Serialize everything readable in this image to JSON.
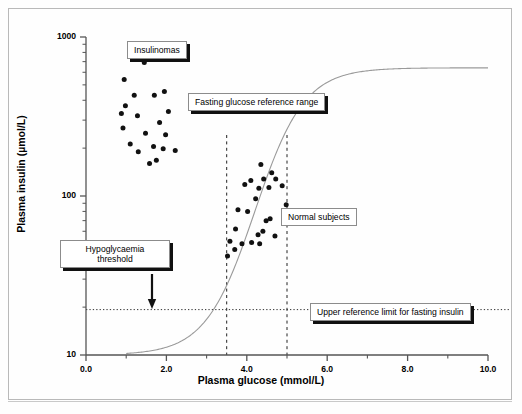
{
  "chart_data": {
    "type": "scatter",
    "title": "",
    "xlabel": "Plasma glucose (mmol/L)",
    "ylabel": "Plasma insulin (µmol/L)",
    "xlim": [
      0.0,
      10.0
    ],
    "ylim": [
      10,
      1000
    ],
    "yscale": "log",
    "xticks": [
      "0.0",
      "2.0",
      "4.0",
      "6.0",
      "8.0",
      "10.0"
    ],
    "xtick_values": [
      0.0,
      2.0,
      4.0,
      6.0,
      8.0,
      10.0
    ],
    "xminor_values": [
      1.0,
      3.0,
      5.0,
      7.0,
      9.0
    ],
    "yticks": [
      "10",
      "100",
      "1000"
    ],
    "ytick_values": [
      10,
      100,
      1000
    ],
    "grid": false,
    "legend": "none",
    "series": [
      {
        "name": "Insulinomas",
        "marker": "filled-circle",
        "color": "#111111",
        "points": [
          {
            "x": 1.45,
            "y": 690
          },
          {
            "x": 0.95,
            "y": 540
          },
          {
            "x": 1.2,
            "y": 430
          },
          {
            "x": 1.7,
            "y": 430
          },
          {
            "x": 1.95,
            "y": 455
          },
          {
            "x": 0.98,
            "y": 370
          },
          {
            "x": 2.05,
            "y": 340
          },
          {
            "x": 1.28,
            "y": 320
          },
          {
            "x": 1.83,
            "y": 290
          },
          {
            "x": 0.92,
            "y": 268
          },
          {
            "x": 1.48,
            "y": 248
          },
          {
            "x": 1.98,
            "y": 243
          },
          {
            "x": 1.1,
            "y": 212
          },
          {
            "x": 1.68,
            "y": 205
          },
          {
            "x": 1.92,
            "y": 198
          },
          {
            "x": 1.3,
            "y": 190
          },
          {
            "x": 2.22,
            "y": 193
          },
          {
            "x": 1.75,
            "y": 168
          },
          {
            "x": 0.88,
            "y": 330
          },
          {
            "x": 1.58,
            "y": 160
          }
        ]
      },
      {
        "name": "Normal subjects",
        "marker": "filled-circle",
        "color": "#111111",
        "points": [
          {
            "x": 4.35,
            "y": 158
          },
          {
            "x": 4.62,
            "y": 140
          },
          {
            "x": 4.1,
            "y": 125
          },
          {
            "x": 4.42,
            "y": 128
          },
          {
            "x": 4.72,
            "y": 128
          },
          {
            "x": 3.95,
            "y": 118
          },
          {
            "x": 4.3,
            "y": 112
          },
          {
            "x": 4.88,
            "y": 116
          },
          {
            "x": 4.55,
            "y": 113
          },
          {
            "x": 4.22,
            "y": 96
          },
          {
            "x": 4.98,
            "y": 88
          },
          {
            "x": 3.78,
            "y": 82
          },
          {
            "x": 4.02,
            "y": 80
          },
          {
            "x": 4.92,
            "y": 80
          },
          {
            "x": 4.58,
            "y": 72
          },
          {
            "x": 4.48,
            "y": 70
          },
          {
            "x": 5.0,
            "y": 68
          },
          {
            "x": 3.72,
            "y": 62
          },
          {
            "x": 4.4,
            "y": 60
          },
          {
            "x": 4.28,
            "y": 57
          },
          {
            "x": 4.7,
            "y": 56
          },
          {
            "x": 3.58,
            "y": 52
          },
          {
            "x": 4.12,
            "y": 51
          },
          {
            "x": 4.32,
            "y": 50
          },
          {
            "x": 3.88,
            "y": 50
          },
          {
            "x": 3.7,
            "y": 46
          },
          {
            "x": 3.52,
            "y": 42
          }
        ]
      }
    ],
    "curve": {
      "name": "insulin-secretion-sigmoid",
      "color": "#9a9a9a",
      "description": "Sigmoid dose-response of plasma insulin to plasma glucose",
      "x_start": 1.0,
      "x_end": 10.0,
      "y_min": 10,
      "y_max": 640,
      "inflection_x": 4.2,
      "steepness": 1.05
    },
    "reference_lines": [
      {
        "name": "fasting-glucose-lower",
        "orientation": "vertical",
        "value": 3.5,
        "style": "dashed"
      },
      {
        "name": "fasting-glucose-upper",
        "orientation": "vertical",
        "value": 5.0,
        "style": "dashed"
      },
      {
        "name": "upper-reference-limit-insulin",
        "orientation": "horizontal",
        "value": 19.3,
        "style": "dotted"
      }
    ],
    "annotations": [
      {
        "name": "insulinomas",
        "text": "Insulinomas",
        "x": 1.95,
        "y": 820,
        "style": "shadow-box"
      },
      {
        "name": "fasting-glucose-reference-range",
        "text": "Fasting glucose reference range",
        "x": 3.55,
        "y": 420,
        "style": "shadow-box"
      },
      {
        "name": "hypoglycaemia-threshold",
        "text": "Hypoglycaemia\nthreshold",
        "x": 1.6,
        "y": 48,
        "style": "shadow-box",
        "arrow": "down"
      },
      {
        "name": "normal-subjects",
        "text": "Normal subjects",
        "x": 5.35,
        "y": 62,
        "style": "plain-box"
      },
      {
        "name": "upper-reference-limit-for-fasting-insulin",
        "text": "Upper reference limit for fasting insulin",
        "x": 6.4,
        "y": 19.3,
        "style": "shadow-box"
      }
    ]
  },
  "labels": {
    "insulinomas": "Insulinomas",
    "fasting_range": "Fasting glucose reference range",
    "hypoglycaemia_line1": "Hypoglycaemia",
    "hypoglycaemia_line2": "threshold",
    "normal_subjects": "Normal subjects",
    "upper_limit": "Upper reference limit for fasting insulin"
  },
  "axes": {
    "x_title": "Plasma glucose (mmol/L)",
    "y_title": "Plasma insulin (µmol/L)",
    "x_ticks": [
      "0.0",
      "2.0",
      "4.0",
      "6.0",
      "8.0",
      "10.0"
    ],
    "y_ticks": [
      "1000",
      "100",
      "10"
    ]
  },
  "colors": {
    "marker": "#111111",
    "curve": "#9a9a9a",
    "axis": "#555555",
    "frame": "#b9b9b9",
    "shadow": "#111111"
  }
}
